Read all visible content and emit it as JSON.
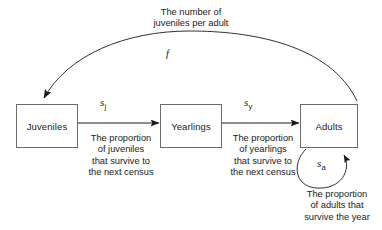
{
  "diagram": {
    "nodes": [
      {
        "id": "juveniles",
        "label": "Juveniles"
      },
      {
        "id": "yearlings",
        "label": "Yearlings"
      },
      {
        "id": "adults",
        "label": "Adults"
      }
    ],
    "edges": [
      {
        "id": "juveniles-to-yearlings",
        "from": "juveniles",
        "to": "yearlings",
        "param": "s",
        "subscript": "j",
        "caption": "The proportion\nof juveniles\nthat survive to\nthe next census"
      },
      {
        "id": "yearlings-to-adults",
        "from": "yearlings",
        "to": "adults",
        "param": "s",
        "subscript": "y",
        "caption": "The proportion\nof yearlings\nthat survive to\nthe next census"
      },
      {
        "id": "adults-self-loop",
        "from": "adults",
        "to": "adults",
        "param": "s",
        "subscript": "a",
        "caption": "The proportion\nof adults that\nsurvive the year"
      },
      {
        "id": "adults-to-juveniles",
        "from": "adults",
        "to": "juveniles",
        "param": "f",
        "subscript": "",
        "caption": "The number of\njuveniles per adult"
      }
    ],
    "colors": {
      "box_border": "#6b6b6b",
      "arrow": "#1a1a1a",
      "text": "#1a1a1a",
      "background": "#ffffff"
    }
  }
}
